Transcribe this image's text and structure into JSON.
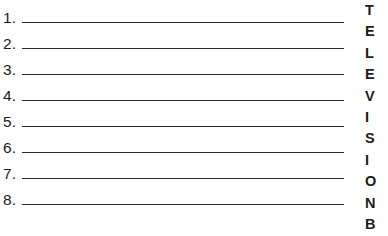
{
  "worksheet": {
    "title": "Numbered answer lines with vertical acrostic column",
    "answer_list": {
      "rows": [
        {
          "number": "1.",
          "value": ""
        },
        {
          "number": "2.",
          "value": ""
        },
        {
          "number": "3.",
          "value": ""
        },
        {
          "number": "4.",
          "value": ""
        },
        {
          "number": "5.",
          "value": ""
        },
        {
          "number": "6.",
          "value": ""
        },
        {
          "number": "7.",
          "value": ""
        },
        {
          "number": "8.",
          "value": ""
        }
      ]
    },
    "letter_column": {
      "word": "TELEVISIONB",
      "letters": [
        {
          "char": "T"
        },
        {
          "char": "E"
        },
        {
          "char": "L"
        },
        {
          "char": "E"
        },
        {
          "char": "V"
        },
        {
          "char": "I"
        },
        {
          "char": "S"
        },
        {
          "char": "I"
        },
        {
          "char": "O"
        },
        {
          "char": "N"
        },
        {
          "char": "B"
        }
      ]
    },
    "colors": {
      "background": "#ffffff",
      "ink": "#1c1c1c",
      "rule": "#2b2b2b"
    }
  }
}
